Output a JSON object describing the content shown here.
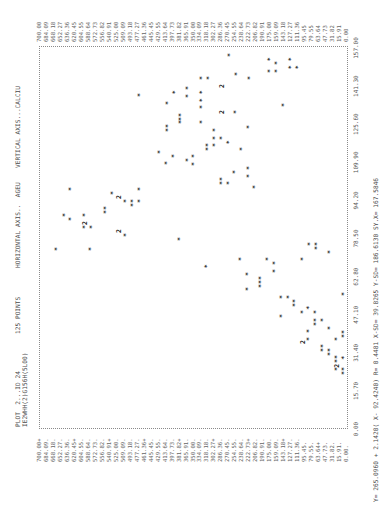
{
  "header": {
    "plot_id": "PLOT  2...ID 24",
    "subtitle": "IE2WHH(2)G156H(5L00)",
    "points_label": "125 POINTS",
    "horizontal_axis": "HORIZONTAL AXIS..  AGEU",
    "vertical_axis": "VERTICAL AXIS...CALCIU"
  },
  "stats": "Y= 265.0960 + 2.1420( X- 92.4240) R= 0.4481 X-SD= 39.8265 Y-SD= 186.6130 SY.X= 167.5846",
  "chart_data": {
    "type": "scatter",
    "xlabel": "AGEU",
    "ylabel": "CALCIU",
    "xlim": [
      0,
      157
    ],
    "ylim": [
      0,
      700
    ],
    "grid": false,
    "legend": "none",
    "x_ticks": [
      "0.00",
      "15.70",
      "31.40",
      "47.10",
      "62.80",
      "78.50",
      "94.20",
      "109.90",
      "125.60",
      "141.30",
      "157.00"
    ],
    "y_ticks": [
      "700.00",
      "684.09",
      "668.18",
      "652.27",
      "636.36",
      "620.45",
      "604.55",
      "588.64",
      "572.73",
      "556.82",
      "540.91",
      "525.00",
      "509.09",
      "493.18",
      "477.27",
      "461.36",
      "445.45",
      "429.55",
      "413.64",
      "397.73",
      "381.82",
      "365.91",
      "350.00",
      "334.09",
      "318.18",
      "302.27",
      "286.36",
      "270.45",
      "254.55",
      "238.64",
      "222.73",
      "206.82",
      "190.91",
      "175.00",
      "159.09",
      "143.18",
      "127.27",
      "111.36",
      "95.45",
      "79.55",
      "63.64",
      "47.73",
      "31.82",
      "15.91",
      "0.00"
    ],
    "annotations": [
      "'2' marks two coincident points"
    ],
    "regression": {
      "intercept": 265.096,
      "slope": 2.142,
      "x_mean": 92.424,
      "r": 0.4481,
      "x_sd": 39.8265,
      "y_sd": 186.613,
      "sy_x": 167.5846
    },
    "points": [
      [
        154.1,
        264.5,
        1
      ],
      [
        152.4,
        173.3,
        1
      ],
      [
        150.8,
        157.3,
        1
      ],
      [
        152.4,
        125.4,
        1
      ],
      [
        147.5,
        173.3,
        1
      ],
      [
        147.5,
        157.3,
        1
      ],
      [
        149.1,
        125.4,
        1
      ],
      [
        149.1,
        109.4,
        1
      ],
      [
        144.6,
        328.3,
        1
      ],
      [
        144.6,
        312.4,
        1
      ],
      [
        146.3,
        248.5,
        1
      ],
      [
        144.6,
        218.9,
        1
      ],
      [
        141.3,
        282.7,
        2
      ],
      [
        140.5,
        360.2,
        1
      ],
      [
        138.8,
        389.9,
        1
      ],
      [
        137.6,
        469.7,
        1
      ],
      [
        137.2,
        360.2,
        1
      ],
      [
        138.8,
        328.3,
        1
      ],
      [
        135.5,
        328.3,
        1
      ],
      [
        132.7,
        328.3,
        1
      ],
      [
        134.3,
        405.8,
        1
      ],
      [
        133.5,
        141.4,
        1
      ],
      [
        130.6,
        282.7,
        2
      ],
      [
        130.6,
        250.8,
        1
      ],
      [
        129.4,
        376.2,
        1
      ],
      [
        127.7,
        376.2,
        1
      ],
      [
        126.5,
        376.2,
        1
      ],
      [
        124.8,
        405.8,
        1
      ],
      [
        123.2,
        405.8,
        1
      ],
      [
        126.5,
        328.3,
        1
      ],
      [
        124.4,
        221.2,
        1
      ],
      [
        123.2,
        298.7,
        1
      ],
      [
        119.9,
        298.7,
        1
      ],
      [
        119.9,
        282.7,
        1
      ],
      [
        118.2,
        266.8,
        1
      ],
      [
        117.0,
        314.6,
        1
      ],
      [
        115.4,
        314.6,
        1
      ],
      [
        117.0,
        298.7,
        1
      ],
      [
        115.4,
        237.1,
        1
      ],
      [
        114.1,
        424.1,
        1
      ],
      [
        112.5,
        392.2,
        1
      ],
      [
        112.5,
        346.6,
        1
      ],
      [
        110.8,
        360.2,
        1
      ],
      [
        109.6,
        408.1,
        1
      ],
      [
        109.2,
        346.6,
        1
      ],
      [
        105.9,
        253.1,
        1
      ],
      [
        107.5,
        221.2,
        1
      ],
      [
        104.2,
        221.2,
        1
      ],
      [
        103.0,
        282.7,
        1
      ],
      [
        101.4,
        282.7,
        1
      ],
      [
        101.4,
        266.8,
        1
      ],
      [
        99.7,
        207.5,
        1
      ],
      [
        98.9,
        627.0,
        1
      ],
      [
        97.2,
        531.3,
        1
      ],
      [
        95.6,
        517.6,
        2
      ],
      [
        93.9,
        501.6,
        1
      ],
      [
        93.9,
        485.7,
        1
      ],
      [
        92.3,
        485.7,
        1
      ],
      [
        98.9,
        469.7,
        1
      ],
      [
        93.9,
        469.7,
        1
      ],
      [
        91.1,
        547.2,
        1
      ],
      [
        89.4,
        547.2,
        1
      ],
      [
        88.2,
        640.7,
        1
      ],
      [
        86.5,
        627.0,
        1
      ],
      [
        88.2,
        595.1,
        1
      ],
      [
        84.9,
        595.1,
        2
      ],
      [
        83.2,
        595.1,
        1
      ],
      [
        83.2,
        579.2,
        1
      ],
      [
        81.6,
        517.6,
        2
      ],
      [
        79.9,
        501.6,
        1
      ],
      [
        78.3,
        378.5,
        1
      ],
      [
        74.2,
        658.9,
        1
      ],
      [
        74.2,
        581.4,
        1
      ],
      [
        76.2,
        82.1,
        1
      ],
      [
        76.2,
        66.1,
        1
      ],
      [
        74.6,
        66.1,
        1
      ],
      [
        72.9,
        36.5,
        1
      ],
      [
        70.0,
        239.4,
        1
      ],
      [
        70.0,
        177.8,
        1
      ],
      [
        68.4,
        161.9,
        1
      ],
      [
        70.0,
        98.0,
        1
      ],
      [
        67.1,
        316.9,
        1
      ],
      [
        65.1,
        161.9,
        1
      ],
      [
        63.9,
        223.5,
        1
      ],
      [
        62.2,
        193.8,
        1
      ],
      [
        60.6,
        193.8,
        1
      ],
      [
        58.9,
        193.8,
        1
      ],
      [
        57.7,
        223.5,
        1
      ],
      [
        55.6,
        4.6,
        1
      ],
      [
        54.4,
        145.9,
        1
      ],
      [
        54.4,
        130.0,
        1
      ],
      [
        52.7,
        116.3,
        1
      ],
      [
        51.1,
        116.3,
        1
      ],
      [
        46.6,
        145.9,
        1
      ],
      [
        48.2,
        98.0,
        1
      ],
      [
        49.9,
        84.4,
        1
      ],
      [
        48.2,
        68.4,
        1
      ],
      [
        44.9,
        68.4,
        1
      ],
      [
        43.3,
        68.4,
        1
      ],
      [
        44.9,
        52.4,
        1
      ],
      [
        41.6,
        36.5,
        1
      ],
      [
        40.0,
        4.6,
        1
      ],
      [
        38.3,
        4.6,
        1
      ],
      [
        40.4,
        84.4,
        1
      ],
      [
        37.1,
        84.4,
        1
      ],
      [
        35.8,
        98.0,
        2
      ],
      [
        37.1,
        20.5,
        1
      ],
      [
        34.2,
        52.4,
        1
      ],
      [
        32.5,
        52.4,
        1
      ],
      [
        32.5,
        36.5,
        1
      ],
      [
        30.9,
        36.5,
        1
      ],
      [
        29.7,
        20.5,
        1
      ],
      [
        28.0,
        20.5,
        1
      ],
      [
        26.0,
        20.5,
        2
      ],
      [
        24.7,
        20.5,
        1
      ],
      [
        29.3,
        4.6,
        1
      ],
      [
        24.7,
        4.6,
        1
      ],
      [
        23.1,
        4.6,
        1
      ]
    ]
  },
  "colors": {
    "ink": "#1e1e1e",
    "label": "#555555",
    "background": "#ffffff"
  }
}
